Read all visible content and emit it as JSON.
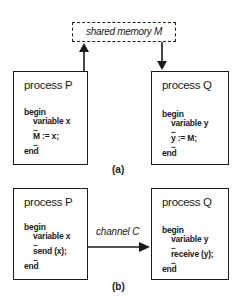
{
  "diagram_a": {
    "shared_memory_label": "shared memory M",
    "process_p": {
      "title": "process P",
      "begin": "begin",
      "decl": "variable  x",
      "dots1": "....",
      "stmt": "M := x;",
      "dots2": "....",
      "end": "end"
    },
    "process_q": {
      "title": "process Q",
      "begin": "begin",
      "decl": "variable  y",
      "dots1": "....",
      "stmt": "y := M;",
      "dots2": "....",
      "end": "end"
    },
    "caption": "(a)"
  },
  "diagram_b": {
    "channel_label": "channel C",
    "process_p": {
      "title": "process P",
      "begin": "begin",
      "decl": "variable  x",
      "dots1": "....",
      "stmt": "send (x);",
      "dots2": "....",
      "end": "end"
    },
    "process_q": {
      "title": "process Q",
      "begin": "begin",
      "decl": "variable  y",
      "dots1": "....",
      "stmt": "receive (y);",
      "dots2": "....",
      "end": "end"
    },
    "caption": "(b)"
  }
}
